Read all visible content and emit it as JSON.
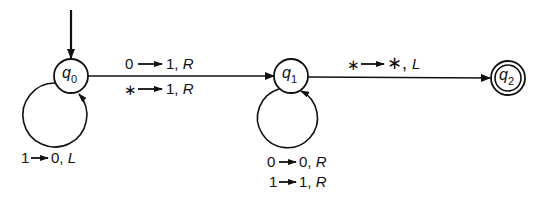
{
  "diagram": {
    "type": "turing-machine-state-diagram",
    "states": [
      {
        "id": "q0",
        "name": "q",
        "sub": "0",
        "start": true,
        "accept": false
      },
      {
        "id": "q1",
        "name": "q",
        "sub": "1",
        "start": false,
        "accept": false
      },
      {
        "id": "q2",
        "name": "q",
        "sub": "2",
        "start": false,
        "accept": true
      }
    ],
    "transitions": [
      {
        "from": "q0",
        "to": "q0",
        "labels": [
          "1 → 0, L"
        ]
      },
      {
        "from": "q0",
        "to": "q1",
        "labels": [
          "0 → 1, R",
          "∗ → 1, R"
        ]
      },
      {
        "from": "q1",
        "to": "q1",
        "labels": [
          "0 → 0, R",
          "1 → 1, R"
        ]
      },
      {
        "from": "q1",
        "to": "q2",
        "labels": [
          "∗ → ∗, L"
        ]
      }
    ],
    "text": {
      "q0_name": "q",
      "q0_sub": "0",
      "q1_name": "q",
      "q1_sub": "1",
      "q2_name": "q",
      "q2_sub": "2",
      "q0_loop_read": "1",
      "q0_loop_write": "0, ",
      "q0_loop_move": "L",
      "q0q1_a_read": "0",
      "q0q1_a_write": "1, ",
      "q0q1_a_move": "R",
      "q0q1_b_read": "∗",
      "q0q1_b_write": "1, ",
      "q0q1_b_move": "R",
      "q1_loop_a_read": "0",
      "q1_loop_a_write": "0, ",
      "q1_loop_a_move": "R",
      "q1_loop_b_read": "1",
      "q1_loop_b_write": "1, ",
      "q1_loop_b_move": "R",
      "q1q2_read": "∗",
      "q1q2_write": "∗, ",
      "q1q2_move": "L"
    }
  }
}
